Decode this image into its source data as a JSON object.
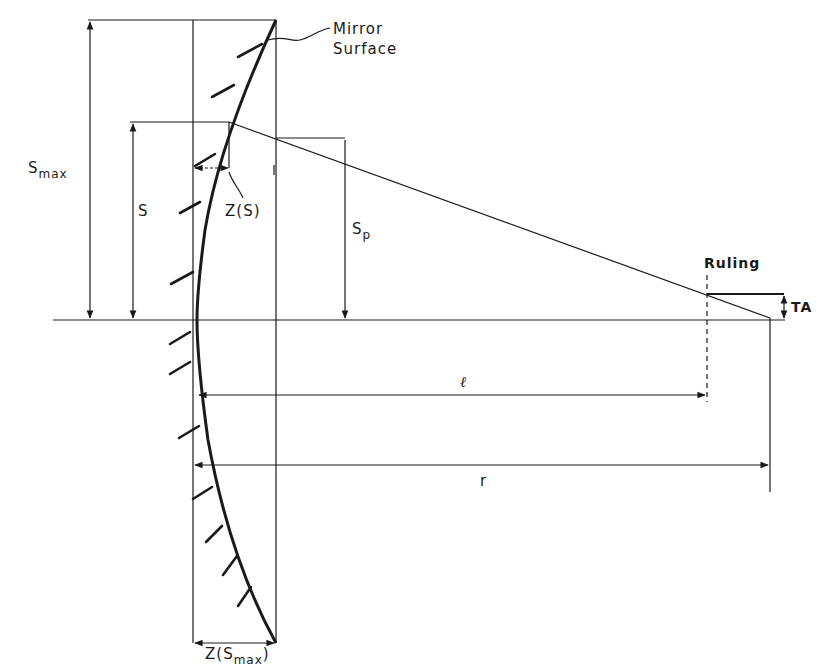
{
  "diagram": {
    "type": "optics-schematic",
    "line_color": "#1a1a1a",
    "background": "#ffffff"
  },
  "labels": {
    "mirror_surface_line1": "Mirror",
    "mirror_surface_line2": "Surface",
    "s_max_main": "S",
    "s_max_sub": "max",
    "s": "S",
    "z_s": "Z(S)",
    "s_p_main": "S",
    "s_p_sub": "p",
    "ruling": "Ruling",
    "ta": "TA",
    "l": "ℓ",
    "r": "r",
    "z_smax_prefix": "Z(S",
    "z_smax_sub": "max",
    "z_smax_suffix": ")"
  },
  "elements": [
    {
      "name": "mirror-curve",
      "description": "Curved mirror surface from top corner to bottom corner, vertex at optical axis"
    },
    {
      "name": "hatch-marks",
      "description": "Diagonal hatching on the back side of the mirror"
    },
    {
      "name": "optical-axis",
      "description": "Horizontal reference line"
    },
    {
      "name": "ray",
      "description": "Ray from mirror point at height S through aperture to focal point"
    },
    {
      "name": "ruling",
      "description": "Dashed vertical line at distance ℓ"
    },
    {
      "name": "dimension-s-max",
      "description": "Vertical dimension from axis to top of mirror"
    },
    {
      "name": "dimension-s",
      "description": "Vertical dimension to ray intersection point"
    },
    {
      "name": "dimension-s-p",
      "description": "Vertical dimension at aperture plane"
    },
    {
      "name": "dimension-z-s",
      "description": "Sag at height S"
    },
    {
      "name": "dimension-z-smax",
      "description": "Sag at maximum height"
    },
    {
      "name": "dimension-l",
      "description": "Distance from mirror vertex to ruling"
    },
    {
      "name": "dimension-r",
      "description": "Distance from mirror to focal point (radius)"
    },
    {
      "name": "dimension-ta",
      "description": "Transverse aberration at ruling"
    }
  ]
}
